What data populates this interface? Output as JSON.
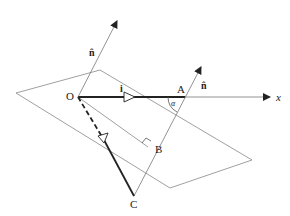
{
  "diagram": {
    "points": {
      "O": {
        "label": "O",
        "x": 78,
        "y": 97
      },
      "A": {
        "label": "A",
        "x": 185,
        "y": 97
      },
      "B": {
        "label": "B",
        "x": 148,
        "y": 147
      },
      "C": {
        "label": "C",
        "x": 134,
        "y": 196
      }
    },
    "labels": {
      "normal_top": "n̂",
      "normal_right": "n̂",
      "unit_i": "i",
      "x_axis": "x",
      "angle": "α"
    },
    "colors": {
      "line": "#222222",
      "plane": "#777777",
      "background": "#ffffff"
    }
  }
}
